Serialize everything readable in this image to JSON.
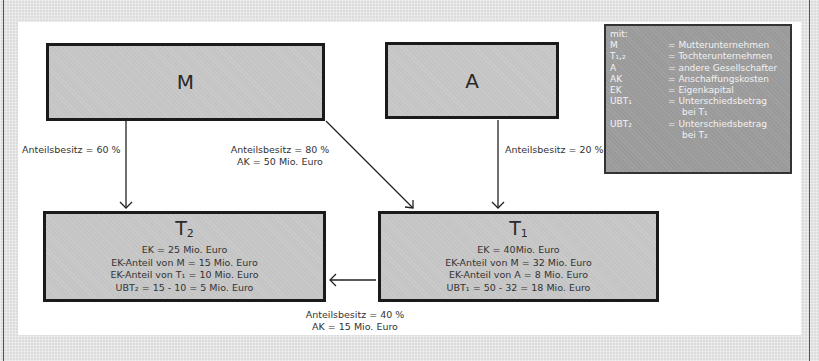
{
  "nodes": {
    "M": {
      "label": "M"
    },
    "A": {
      "label": "A"
    },
    "T2": {
      "title": "T",
      "title_sub": "2",
      "lines": [
        "EK = 25 Mio. Euro",
        "EK-Anteil von M = 15 Mio. Euro",
        "EK-Anteil von T₁ = 10 Mio. Euro",
        "UBT₂ = 15 - 10 = 5 Mio. Euro"
      ]
    },
    "T1": {
      "title": "T",
      "title_sub": "1",
      "lines": [
        "EK = 40Mio.  Euro",
        "EK-Anteil von M = 32 Mio. Euro",
        "EK-Anteil von A = 8 Mio. Euro",
        "UBT₁ = 50 - 32 = 18 Mio. Euro"
      ]
    }
  },
  "edges": {
    "M_T2": {
      "line1": "Anteilsbesitz = 60 %"
    },
    "M_T1": {
      "line1": "Anteilsbesitz = 80 %",
      "line2": "AK = 50 Mio. Euro"
    },
    "A_T1": {
      "line1": "Anteilsbesitz = 20 %"
    },
    "T1_T2": {
      "line1": "Anteilsbesitz = 40 %",
      "line2": "AK = 15 Mio. Euro"
    }
  },
  "legend": {
    "heading": "mit:",
    "items": [
      {
        "key": "M",
        "value": "= Mutterunternehmen"
      },
      {
        "key": "T₁,₂",
        "value": "= Tochterunternehmen"
      },
      {
        "key": "A",
        "value": "= andere Gesellschafter"
      },
      {
        "key": "AK",
        "value": "= Anschaffungskosten"
      },
      {
        "key": "EK",
        "value": "= Eigenkapital"
      },
      {
        "key": "UBT₁",
        "value": "= Unterschiedsbetrag",
        "cont": "bei T₁"
      },
      {
        "key": "UBT₂",
        "value": "= Unterschiedsbetrag",
        "cont": "bei T₂"
      }
    ]
  }
}
